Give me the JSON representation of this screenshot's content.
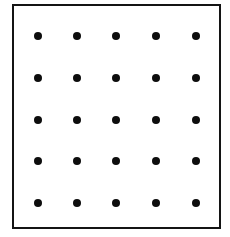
{
  "figure": {
    "canvas": {
      "width": 230,
      "height": 237,
      "background_color": "#ffffff"
    },
    "frame": {
      "name": "square-border",
      "left": 12,
      "top": 4,
      "width": 209,
      "height": 225,
      "border_width": 2,
      "border_color": "#141414",
      "fill_color": "#ffffff"
    },
    "dot_style": {
      "diameter": 8,
      "color": "#0d0d0d",
      "shape": "circle"
    },
    "grid": {
      "rows": 5,
      "columns": 5,
      "total_dots": 25,
      "column_centers_x": [
        38,
        77,
        116,
        156,
        196
      ],
      "row_centers_y": [
        36,
        78,
        120,
        161,
        203
      ],
      "column_spacing": 39.5,
      "row_spacing": 41.75
    }
  },
  "chart_data": {
    "type": "scatter",
    "title": "",
    "xlabel": "",
    "ylabel": "",
    "grid": false,
    "legend": false,
    "xlim": [
      0,
      6
    ],
    "ylim": [
      0,
      6
    ],
    "x": [
      1,
      2,
      3,
      4,
      5,
      1,
      2,
      3,
      4,
      5,
      1,
      2,
      3,
      4,
      5,
      1,
      2,
      3,
      4,
      5,
      1,
      2,
      3,
      4,
      5
    ],
    "y": [
      5,
      5,
      5,
      5,
      5,
      4,
      4,
      4,
      4,
      4,
      3,
      3,
      3,
      3,
      3,
      2,
      2,
      2,
      2,
      2,
      1,
      1,
      1,
      1,
      1
    ],
    "marker": "o",
    "marker_color": "#0d0d0d",
    "marker_size": 8
  }
}
